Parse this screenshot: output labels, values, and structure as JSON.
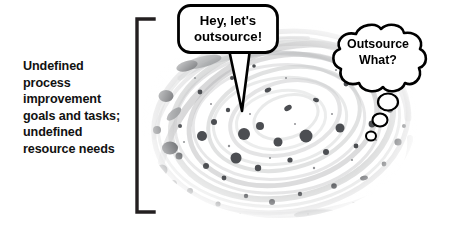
{
  "canvas": {
    "width": 450,
    "height": 240,
    "background_color": "#ffffff"
  },
  "caption": {
    "text": "Undefined process improvement goals and tasks; undefined resource needs",
    "color": "#111111"
  },
  "bracket": {
    "name": "left-square-bracket",
    "color": "#231f20"
  },
  "speech_bubble": {
    "kind": "speech",
    "text": "Hey, let's\noutsource!",
    "outline_color": "#000000",
    "fill_color": "#ffffff"
  },
  "thought_bubble": {
    "kind": "thought",
    "text": "Outsource\nWhat?",
    "outline_color": "#000000",
    "fill_color": "#ffffff",
    "trail_bubbles": 3
  },
  "artwork": {
    "name": "ink-swirl-splatter",
    "description": "Grey concentric swirl with dark ink splatter blobs",
    "swirl_color": "#c9cacb",
    "blob_color": "#4c4e52"
  }
}
